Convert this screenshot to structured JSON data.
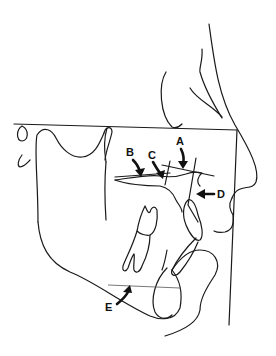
{
  "diagram": {
    "type": "cephalometric tracing (lateral skull profile)",
    "colors": {
      "line": "#1a1a1a",
      "background": "#ffffff"
    },
    "labels": [
      {
        "id": "A",
        "text": "A"
      },
      {
        "id": "B",
        "text": "B"
      },
      {
        "id": "C",
        "text": "C"
      },
      {
        "id": "D",
        "text": "D"
      },
      {
        "id": "E",
        "text": "E"
      }
    ]
  }
}
